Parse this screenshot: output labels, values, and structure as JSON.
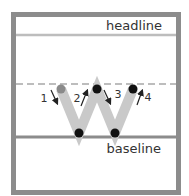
{
  "labels": {
    "headline": "headline",
    "baseline": "baseline"
  },
  "strokes": [
    {
      "number": "1",
      "direction": "down"
    },
    {
      "number": "2",
      "direction": "up"
    },
    {
      "number": "3",
      "direction": "down"
    },
    {
      "number": "4",
      "direction": "up"
    }
  ],
  "colors": {
    "frame": "#8c8c8c",
    "headline_rule": "#bdbdbd",
    "midline_dashed": "#bdbdbd",
    "baseline_rule": "#8c8c8c",
    "letter_stroke": "#c9c9c9",
    "start_dot": "#8a8a8a",
    "point_dot": "#111111",
    "arrow": "#222222"
  },
  "letter": "W"
}
